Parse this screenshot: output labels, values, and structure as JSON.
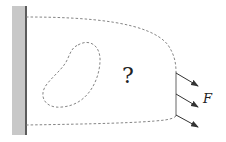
{
  "diagram": {
    "question_mark": "?",
    "force_label": "F",
    "elements": [
      "fixed-wall",
      "unknown-body-domain",
      "internal-hole",
      "applied-forces"
    ],
    "colors": {
      "wall_fill": "#c8c8c8",
      "wall_edge": "#333333",
      "boundary": "#777777",
      "arrow": "#333333"
    }
  }
}
